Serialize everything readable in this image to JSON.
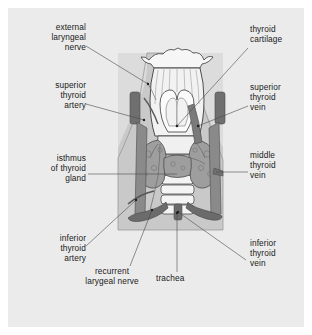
{
  "figure": {
    "background_color": "#ebebeb",
    "field_color": "#c9c9c9",
    "page_color": "#ffffff",
    "ink_color": "#1a1a1a",
    "vessel_dark_color": "#6e6e6e",
    "gland_color": "#9a9a9a",
    "cartilage_color": "#f2f2f2"
  },
  "labels": {
    "external_laryngeal_nerve": "external\nlaryngeal\nnerve",
    "superior_thyroid_artery": "superior\nthyroid\nartery",
    "isthmus_of_thyroid_gland": "isthmus\nof thyroid\ngland",
    "inferior_thyroid_artery": "inferior\nthyroid\nartery",
    "recurrent_laryngeal_nerve": "recurrent\nlarygeal nerve",
    "trachea": "trachea",
    "thyroid_cartilage": "thyroid\ncartilage",
    "superior_thyroid_vein": "superior\nthyroid\nvein",
    "middle_thyroid_vein": "middle\nthyroid\nvein",
    "inferior_thyroid_vein": "inferior\nthyroid\nvein"
  }
}
